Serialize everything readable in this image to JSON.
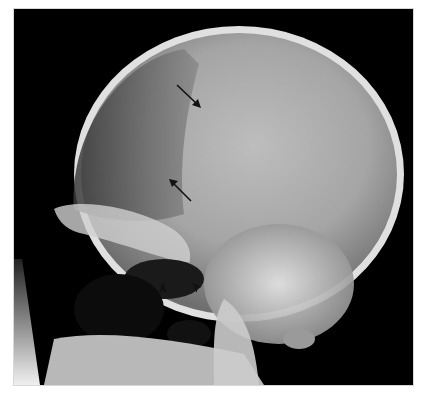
{
  "image": {
    "subject": "lateral skull radiograph",
    "background_color": "#000000",
    "page_color": "#ffffff",
    "frame": {
      "x": 14,
      "y": 9,
      "width": 399,
      "height": 376
    }
  },
  "annotations": {
    "arrows": [
      {
        "name": "upper-arrow",
        "direction": "down-right",
        "tail": [
          177,
          85
        ],
        "head": [
          200,
          107
        ],
        "color": "#111111"
      },
      {
        "name": "lower-arrow",
        "direction": "up-left",
        "tail": [
          191,
          201
        ],
        "head": [
          169,
          180
        ],
        "color": "#111111"
      }
    ],
    "arrowheads": [
      {
        "name": "left-arrowhead",
        "direction": "up",
        "position": [
          163,
          290
        ],
        "color": "#111111"
      },
      {
        "name": "right-arrowhead",
        "direction": "up-left",
        "position": [
          196,
          286
        ],
        "color": "#111111"
      }
    ]
  }
}
